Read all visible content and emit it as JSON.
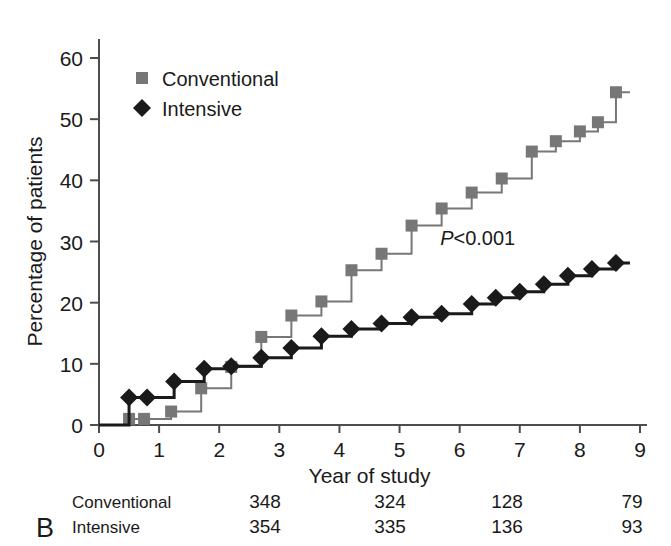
{
  "panel": {
    "letter": "B"
  },
  "chart_data": {
    "type": "line",
    "title": "",
    "subtitle": "",
    "xlabel": "Year of study",
    "ylabel": "Percentage of patients",
    "xlim": [
      0,
      9
    ],
    "ylim": [
      0,
      63
    ],
    "xticks": [
      0,
      1,
      2,
      3,
      4,
      5,
      6,
      7,
      8,
      9
    ],
    "xtick_labels": [
      "0",
      "1",
      "2",
      "3",
      "4",
      "5",
      "6",
      "7",
      "8",
      "9"
    ],
    "yticks": [
      0,
      10,
      20,
      30,
      40,
      50,
      60
    ],
    "ytick_labels": [
      "0",
      "10",
      "20",
      "30",
      "40",
      "50",
      "60"
    ],
    "grid": false,
    "legend_position": "top-left",
    "step_type": "post",
    "annotations": [
      {
        "text_italic": "P",
        "text": "<0.001",
        "x": 6.3,
        "y": 29.5
      }
    ],
    "series": [
      {
        "name": "Conventional",
        "color": "#777777",
        "marker": "square",
        "line_width": 2,
        "x": [
          0.5,
          0.75,
          1.2,
          1.7,
          2.2,
          2.7,
          3.2,
          3.7,
          4.2,
          4.7,
          5.2,
          5.7,
          6.2,
          6.7,
          7.2,
          7.6,
          8.0,
          8.3,
          8.6
        ],
        "y": [
          1.0,
          1.0,
          2.2,
          6.0,
          9.5,
          14.4,
          17.9,
          20.2,
          25.3,
          28.0,
          32.6,
          35.4,
          38.0,
          40.3,
          44.7,
          46.4,
          48.0,
          49.5,
          54.4
        ]
      },
      {
        "name": "Intensive",
        "color": "#1a1a1a",
        "marker": "diamond",
        "line_width": 3,
        "x": [
          0.5,
          0.8,
          1.25,
          1.75,
          2.2,
          2.7,
          3.2,
          3.7,
          4.2,
          4.7,
          5.2,
          5.7,
          6.2,
          6.6,
          7.0,
          7.4,
          7.8,
          8.2,
          8.6
        ],
        "y": [
          4.5,
          4.5,
          7.1,
          9.2,
          9.6,
          11.0,
          12.6,
          14.5,
          15.7,
          16.6,
          17.6,
          18.2,
          19.8,
          20.8,
          21.8,
          23.0,
          24.4,
          25.5,
          26.5
        ]
      }
    ]
  },
  "legend": {
    "items": [
      {
        "label": "Conventional",
        "marker": "square",
        "color": "#777777"
      },
      {
        "label": "Intensive",
        "marker": "diamond",
        "color": "#1a1a1a"
      }
    ]
  },
  "risk_table": {
    "rows": [
      {
        "label": "Conventional",
        "values": [
          "348",
          "324",
          "128",
          "79"
        ]
      },
      {
        "label": "Intensive",
        "values": [
          "354",
          "335",
          "136",
          "93"
        ]
      }
    ],
    "value_x_positions": [
      265,
      390,
      507,
      632
    ]
  }
}
